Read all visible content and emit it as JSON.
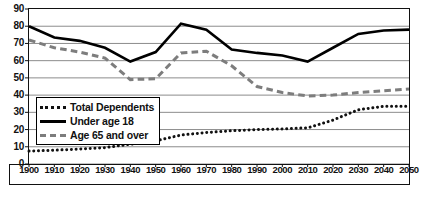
{
  "chart_data": {
    "type": "line",
    "title": "",
    "subtitle": "",
    "xlabel": "",
    "ylabel": "",
    "xlim": [
      1900,
      2050
    ],
    "ylim": [
      0,
      90
    ],
    "ytick_step": 10,
    "xtick_step": 10,
    "grid": true,
    "legend_position": "inside-left-lower",
    "x": [
      1900,
      1910,
      1920,
      1930,
      1940,
      1950,
      1960,
      1970,
      1980,
      1990,
      2000,
      2010,
      2020,
      2030,
      2040,
      2050
    ],
    "xticklabels": [
      "1900",
      "1910",
      "1920",
      "1930",
      "1940",
      "1950",
      "1960",
      "1970",
      "1980",
      "1990",
      "2000",
      "2010",
      "2020",
      "2030",
      "2040",
      "2050"
    ],
    "yticklabels": [
      "0",
      "10",
      "20",
      "30",
      "40",
      "50",
      "60",
      "70",
      "80",
      "90"
    ],
    "yticks": [
      0,
      10,
      20,
      30,
      40,
      50,
      60,
      70,
      80,
      90
    ],
    "series": [
      {
        "name": "Total Dependents",
        "style": "dotted",
        "color": "#111111",
        "values": [
          7.5,
          8.0,
          8.7,
          9.5,
          11.5,
          13.5,
          16.8,
          18.3,
          19.3,
          20.0,
          20.4,
          21.0,
          25.5,
          31.5,
          33.5,
          33.5
        ]
      },
      {
        "name": "Under age 18",
        "style": "solid",
        "color": "#000000",
        "values": [
          80.0,
          73.5,
          71.5,
          67.5,
          59.5,
          65.0,
          81.5,
          78.0,
          66.5,
          64.5,
          63.0,
          59.5,
          67.5,
          75.5,
          77.5,
          78.0
        ]
      },
      {
        "name": "Age 65 and over",
        "style": "dashed",
        "color": "#7d7d7d",
        "values": [
          72.0,
          67.5,
          65.0,
          61.5,
          49.0,
          49.5,
          64.5,
          65.5,
          57.0,
          45.0,
          41.5,
          39.5,
          40.0,
          41.5,
          42.5,
          43.5
        ]
      }
    ]
  },
  "legend": {
    "items": [
      {
        "label": "Total Dependents",
        "key": "dotted-line-key"
      },
      {
        "label": "Under age 18",
        "key": "solid-line-key"
      },
      {
        "label": "Age 65 and over",
        "key": "dashed-line-key"
      }
    ]
  }
}
